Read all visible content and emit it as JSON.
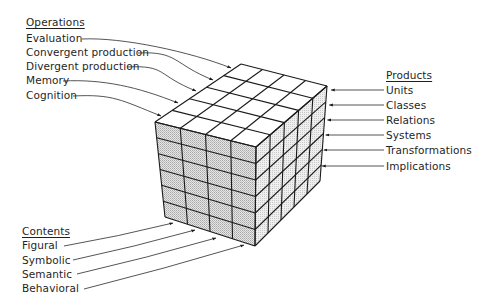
{
  "diagram": {
    "operations": {
      "heading": "Operations",
      "items": [
        "Evaluation",
        "Convergent production",
        "Divergent production",
        "Memory",
        "Cognition"
      ]
    },
    "products": {
      "heading": "Products",
      "items": [
        "Units",
        "Classes",
        "Relations",
        "Systems",
        "Transformations",
        "Implications"
      ]
    },
    "contents": {
      "heading": "Contents",
      "items": [
        "Figural",
        "Symbolic",
        "Semantic",
        "Behavioral"
      ]
    },
    "cube": {
      "front_columns": 4,
      "rows": 6,
      "depth": 5,
      "colors": {
        "top": "#ffffff",
        "front": "#cfcfcf",
        "right": "#e2e2e2",
        "line": "#1a1a1a"
      }
    }
  }
}
